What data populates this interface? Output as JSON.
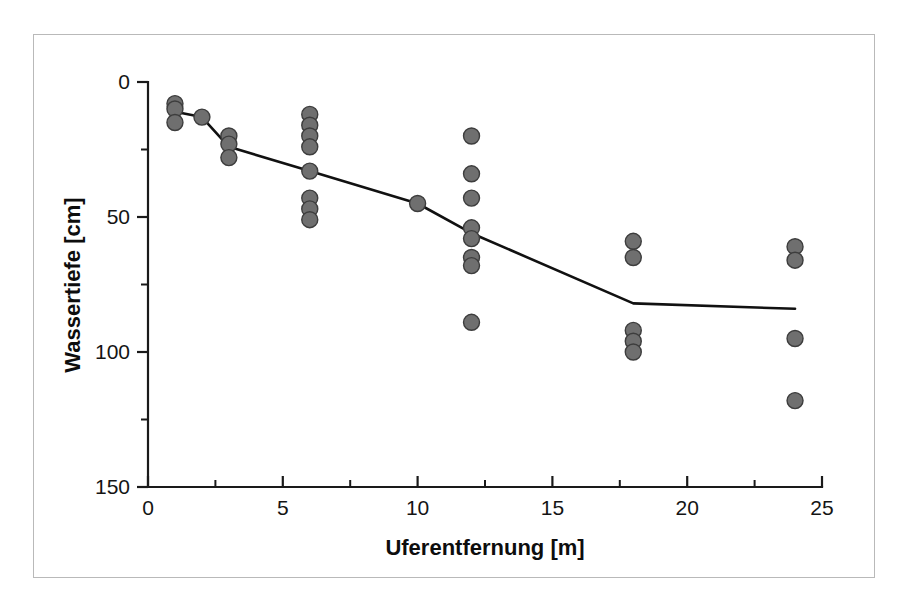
{
  "chart_data": {
    "type": "scatter",
    "title": "",
    "xlabel": "Uferentfernung [m]",
    "ylabel": "Wassertiefe [cm]",
    "xlim": [
      0,
      25
    ],
    "ylim": [
      0,
      150
    ],
    "y_inverted": true,
    "grid": false,
    "legend": null,
    "x_ticks": [
      0,
      5,
      10,
      15,
      20,
      25
    ],
    "x_tick_labels": [
      "0",
      "5",
      "10",
      "15",
      "20",
      "25"
    ],
    "x_minor_ticks": [
      2.5,
      7.5,
      12.5,
      17.5,
      22.5
    ],
    "y_ticks": [
      0,
      50,
      100,
      150
    ],
    "y_tick_labels": [
      "0",
      "50",
      "100",
      "150"
    ],
    "y_minor_ticks": [
      25,
      75,
      125
    ],
    "series": [
      {
        "name": "Einzelmessungen",
        "type": "scatter",
        "marker": "filled-circle",
        "color": "#6f6f6f",
        "edge_color": "#3d3d3d",
        "points": [
          {
            "x": 1,
            "y": 8
          },
          {
            "x": 1,
            "y": 10
          },
          {
            "x": 1,
            "y": 15
          },
          {
            "x": 2,
            "y": 13
          },
          {
            "x": 3,
            "y": 20
          },
          {
            "x": 3,
            "y": 23
          },
          {
            "x": 3,
            "y": 28
          },
          {
            "x": 6,
            "y": 12
          },
          {
            "x": 6,
            "y": 16
          },
          {
            "x": 6,
            "y": 20
          },
          {
            "x": 6,
            "y": 24
          },
          {
            "x": 6,
            "y": 33
          },
          {
            "x": 6,
            "y": 43
          },
          {
            "x": 6,
            "y": 47
          },
          {
            "x": 6,
            "y": 51
          },
          {
            "x": 10,
            "y": 45
          },
          {
            "x": 12,
            "y": 20
          },
          {
            "x": 12,
            "y": 34
          },
          {
            "x": 12,
            "y": 43
          },
          {
            "x": 12,
            "y": 54
          },
          {
            "x": 12,
            "y": 58
          },
          {
            "x": 12,
            "y": 65
          },
          {
            "x": 12,
            "y": 68
          },
          {
            "x": 12,
            "y": 89
          },
          {
            "x": 18,
            "y": 59
          },
          {
            "x": 18,
            "y": 65
          },
          {
            "x": 18,
            "y": 92
          },
          {
            "x": 18,
            "y": 96
          },
          {
            "x": 18,
            "y": 100
          },
          {
            "x": 24,
            "y": 61
          },
          {
            "x": 24,
            "y": 66
          },
          {
            "x": 24,
            "y": 95
          },
          {
            "x": 24,
            "y": 118
          }
        ]
      },
      {
        "name": "Mittelwertlinie",
        "type": "line",
        "color": "#111111",
        "points": [
          {
            "x": 1,
            "y": 11
          },
          {
            "x": 2,
            "y": 13
          },
          {
            "x": 3,
            "y": 24
          },
          {
            "x": 6,
            "y": 33
          },
          {
            "x": 10,
            "y": 45
          },
          {
            "x": 12,
            "y": 56
          },
          {
            "x": 18,
            "y": 82
          },
          {
            "x": 24,
            "y": 84
          }
        ]
      }
    ]
  },
  "figure": {
    "frame_color": "#b9b9b9",
    "background": "#ffffff",
    "axis_color": "#1a1a1a"
  }
}
